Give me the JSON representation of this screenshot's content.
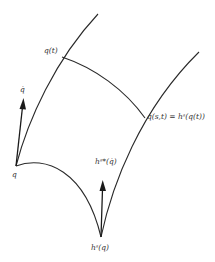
{
  "diagram": {
    "title": "",
    "colors": {
      "stroke": "#2a2a2a",
      "text": "#333333",
      "background": "#ffffff"
    },
    "labels": {
      "q_dot": "q̇",
      "q": "q",
      "q_t": "q(t)",
      "q_st": "q(s,t) = hˢ(q(t))",
      "hs_star_qdot": "hˢ*(q̇)",
      "hs_q": "hˢ(q)"
    },
    "curves": [
      {
        "name": "left-curve",
        "from": "q",
        "to": "top",
        "through": "q(t)"
      },
      {
        "name": "bottom-curve",
        "from": "q",
        "to": "hs(q)"
      },
      {
        "name": "right-curve",
        "from": "hs(q)",
        "to": "top-right",
        "through": "q(s,t)"
      },
      {
        "name": "middle-curve",
        "from": "q(t)",
        "to": "q(s,t)"
      }
    ],
    "vectors": [
      {
        "name": "q-dot-vector",
        "from": "q",
        "label": "q̇"
      },
      {
        "name": "pushforward-vector",
        "from": "hs(q)",
        "label": "hˢ*(q̇)"
      }
    ]
  }
}
